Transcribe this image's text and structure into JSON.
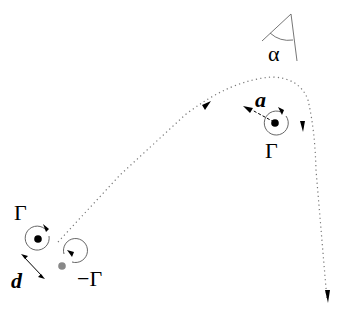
{
  "diagram": {
    "labels": {
      "angle": "α",
      "separation_top": "a",
      "circulation_top": "Γ",
      "circulation_left": "Γ",
      "separation_bottom": "d",
      "circulation_negative": "−Γ"
    },
    "colors": {
      "positive_vortex": "#000000",
      "negative_vortex": "#888888",
      "path": "#777777",
      "circle": "#555555"
    }
  }
}
